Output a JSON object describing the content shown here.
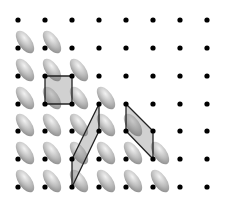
{
  "diagram": {
    "title": "",
    "canvas": {
      "width": 226,
      "height": 203,
      "background": "#ffffff"
    },
    "lattice": {
      "columns_x": [
        18,
        45,
        72,
        99,
        126,
        153,
        180,
        207
      ],
      "rows_y": [
        20,
        48,
        76,
        104,
        131,
        159,
        187
      ],
      "dot_radius": 2.6,
      "dot_color": "#000000"
    },
    "ellipses": {
      "description": "Shaded tilted ellipses attached to lattice points (dot at lower-left end)",
      "rx": 13,
      "ry": 6.5,
      "rotation_deg": 55,
      "offset": [
        7,
        -6
      ],
      "light_color": "#f2f2f2",
      "mid_color": "#bdbdbd",
      "dark_color": "#8a8a8a",
      "rows": [
        {
          "row": 1,
          "cols": [
            0,
            1
          ]
        },
        {
          "row": 2,
          "cols": [
            0,
            1,
            2
          ]
        },
        {
          "row": 3,
          "cols": [
            0,
            1,
            2,
            3
          ]
        },
        {
          "row": 4,
          "cols": [
            0,
            1,
            2,
            3,
            4
          ]
        },
        {
          "row": 5,
          "cols": [
            0,
            1,
            2,
            3,
            4,
            5
          ]
        },
        {
          "row": 6,
          "cols": [
            0,
            1,
            2,
            3,
            4,
            5
          ]
        }
      ]
    },
    "cells": [
      {
        "name": "square-unit-cell",
        "points": [
          [
            45,
            76
          ],
          [
            72,
            76
          ],
          [
            72,
            104
          ],
          [
            45,
            104
          ]
        ]
      },
      {
        "name": "oblique-unit-cell-1",
        "points": [
          [
            99,
            104
          ],
          [
            99,
            131
          ],
          [
            72,
            187
          ],
          [
            72,
            159
          ]
        ]
      },
      {
        "name": "oblique-unit-cell-2",
        "points": [
          [
            126,
            104
          ],
          [
            153,
            131
          ],
          [
            153,
            159
          ],
          [
            126,
            131
          ]
        ]
      }
    ],
    "cell_style": {
      "fill": "#7a7a7a",
      "fill_opacity": 0.35,
      "stroke": "#222222",
      "stroke_width": 1.3
    }
  }
}
